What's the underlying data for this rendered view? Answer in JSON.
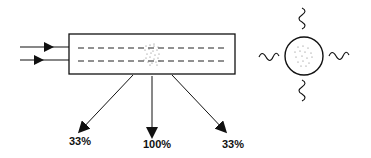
{
  "diagram": {
    "colors": {
      "stroke": "#111111",
      "dots": "#777777",
      "background": "#ffffff"
    },
    "input_arrows": [
      {
        "name": "input-arrow-upper"
      },
      {
        "name": "input-arrow-lower"
      }
    ],
    "waveguide": {
      "dashed_lines": 2,
      "scatter_center": "dotted-region"
    },
    "output_arrows": [
      {
        "label": "33%"
      },
      {
        "label": "100%"
      },
      {
        "label": "33%"
      }
    ],
    "particle": {
      "shape": "circle",
      "emission": "wavy-lines-4-directions"
    }
  }
}
